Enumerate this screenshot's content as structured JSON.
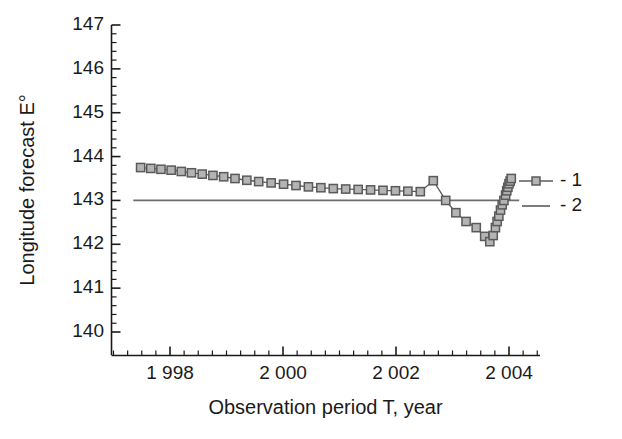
{
  "chart_data": {
    "type": "line",
    "title": "",
    "xlabel": "Observation period T, year",
    "ylabel": "Longitude forecast E°",
    "xlim": [
      1997.0,
      2004.5
    ],
    "ylim": [
      140,
      147
    ],
    "grid": false,
    "xticks": [
      1998,
      2000,
      2002,
      2004
    ],
    "xtick_labels": [
      "1 998",
      "2 000",
      "2 002",
      "2 004"
    ],
    "yticks": [
      140,
      141,
      142,
      143,
      144,
      145,
      146,
      147
    ],
    "ytick_labels": [
      "140",
      "141",
      "142",
      "143",
      "144",
      "145",
      "146",
      "147"
    ],
    "minor_ticks_per_interval": 4,
    "legend_position": "upper right",
    "legend": [
      {
        "key": "1",
        "label": "- 1",
        "style": "line-with-square-markers"
      },
      {
        "key": "2",
        "label": "- 2",
        "style": "plain-line"
      }
    ],
    "series": [
      {
        "name": "1",
        "marker": "square",
        "color": "#5a5a5a",
        "marker_face_color": "#b4b4b4",
        "x": [
          1997.48,
          1997.66,
          1997.84,
          1998.02,
          1998.2,
          1998.38,
          1998.57,
          1998.76,
          1998.95,
          1999.15,
          1999.36,
          1999.57,
          1999.79,
          2000.01,
          2000.23,
          2000.45,
          2000.67,
          2000.89,
          2001.11,
          2001.33,
          2001.55,
          2001.77,
          2001.99,
          2002.21,
          2002.43,
          2002.66,
          2002.88,
          2003.06,
          2003.24,
          2003.42,
          2003.57,
          2003.66,
          2003.72,
          2003.76,
          2003.79,
          2003.82,
          2003.85,
          2003.88,
          2003.91,
          2003.94,
          2003.96,
          2003.98,
          2004.0,
          2004.02,
          2004.04
        ],
        "y": [
          143.75,
          143.73,
          143.71,
          143.69,
          143.66,
          143.63,
          143.6,
          143.57,
          143.54,
          143.5,
          143.46,
          143.43,
          143.4,
          143.37,
          143.34,
          143.31,
          143.29,
          143.27,
          143.26,
          143.25,
          143.24,
          143.23,
          143.22,
          143.21,
          143.2,
          143.45,
          143.0,
          142.72,
          142.52,
          142.38,
          142.18,
          142.06,
          142.2,
          142.38,
          142.52,
          142.64,
          142.78,
          142.9,
          143.0,
          143.12,
          143.22,
          143.3,
          143.38,
          143.44,
          143.5
        ]
      },
      {
        "name": "2",
        "marker": "none",
        "color": "#6e6e6e",
        "constant_value": 143,
        "x": [
          1997.35,
          2004.18
        ],
        "y": [
          143,
          143
        ]
      }
    ]
  },
  "axes": {
    "x_title": "Observation period T, year",
    "y_title": "Longitude forecast E°"
  },
  "colors": {
    "axis": "#1a1a1a",
    "series1_line": "#5a5a5a",
    "series1_fill": "#b4b4b4",
    "series2_line": "#6e6e6e",
    "text": "#1a1a1a",
    "background": "#ffffff"
  }
}
